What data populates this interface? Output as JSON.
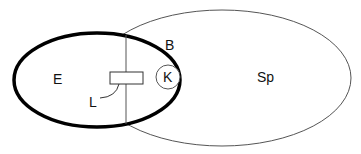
{
  "diagram": {
    "labels": {
      "E": "E",
      "B": "B",
      "K": "K",
      "L": "L",
      "Sp": "Sp"
    },
    "colors": {
      "bold_outline": "#000000",
      "thin_outline": "#555555",
      "text": "#111111",
      "background": "#ffffff"
    }
  }
}
